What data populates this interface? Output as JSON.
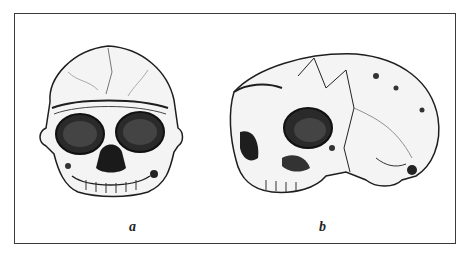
{
  "figure": {
    "panels": [
      {
        "label": "a",
        "description": "skull frontal view"
      },
      {
        "label": "b",
        "description": "skull three-quarter lateral view"
      }
    ],
    "colors": {
      "ink": "#1e1e1e",
      "frame": "#3a3a3a",
      "background": "#ffffff"
    }
  }
}
